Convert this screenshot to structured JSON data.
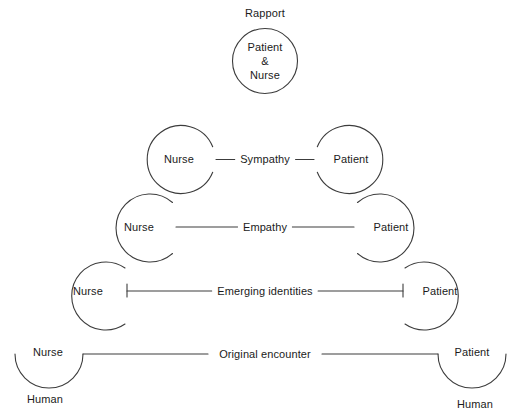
{
  "figure": {
    "type": "conceptual-diagram",
    "title": "Rapport",
    "background_color": "#ffffff",
    "stroke_color": "#3c3c3c"
  },
  "apex": {
    "title": "Rapport",
    "circle_text": "Patient\n&\nNurse"
  },
  "rows": [
    {
      "id": "sympathy",
      "stage": "Sympathy",
      "left_label": "Nurse",
      "right_label": "Patient"
    },
    {
      "id": "empathy",
      "stage": "Empathy",
      "left_label": "Nurse",
      "right_label": "Patient"
    },
    {
      "id": "emerging-identities",
      "stage": "Emerging identities",
      "left_label": "Nurse",
      "right_label": "Patient"
    },
    {
      "id": "original-encounter",
      "stage": "Original encounter",
      "left_label": "Nurse",
      "right_label": "Patient",
      "left_sub_label": "Human",
      "right_sub_label": "Human"
    }
  ]
}
